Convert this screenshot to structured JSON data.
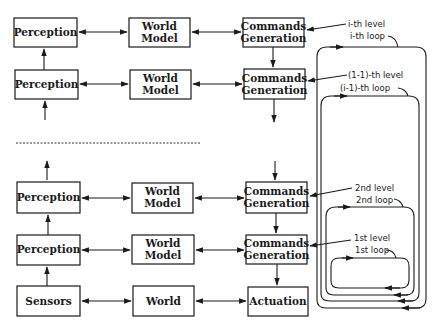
{
  "diagram": {
    "columns": [
      "Perception",
      "World Model",
      "Commands Generation"
    ],
    "levels": [
      {
        "id": "i",
        "perception": "Perception",
        "world_model": [
          "World",
          "Model"
        ],
        "commands": [
          "Commands",
          "Generation"
        ],
        "level_label": "i-th level",
        "loop_label": "i-th loop"
      },
      {
        "id": "i-1",
        "perception": "Perception",
        "world_model": [
          "World",
          "Model"
        ],
        "commands": [
          "Commands",
          "Generation"
        ],
        "level_label": "(1-1)-th level",
        "loop_label": "(i-1)-th loop"
      },
      {
        "id": "2",
        "perception": "Perception",
        "world_model": [
          "World",
          "Model"
        ],
        "commands": [
          "Commands",
          "Generation"
        ],
        "level_label": "2nd level",
        "loop_label": "2nd loop"
      },
      {
        "id": "1",
        "perception": "Perception",
        "world_model": [
          "World",
          "Model"
        ],
        "commands": [
          "Commands",
          "Generation"
        ],
        "level_label": "1st level",
        "loop_label": "1st loop"
      }
    ],
    "base": {
      "sensors": "Sensors",
      "world": "World",
      "actuation": "Actuation"
    }
  }
}
